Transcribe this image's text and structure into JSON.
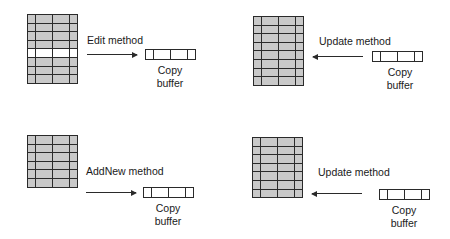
{
  "panels": [
    {
      "id": "edit",
      "method_label": "Edit method",
      "arrow_direction": "right",
      "grid_rows": 8,
      "highlighted_row": 5,
      "buffer_caption_line1": "Copy",
      "buffer_caption_line2": "buffer"
    },
    {
      "id": "update-top",
      "method_label": "Update method",
      "arrow_direction": "left",
      "grid_rows": 8,
      "highlighted_row": null,
      "buffer_caption_line1": "Copy",
      "buffer_caption_line2": "buffer"
    },
    {
      "id": "addnew",
      "method_label": "AddNew method",
      "arrow_direction": "right",
      "grid_rows": 6,
      "highlighted_row": null,
      "buffer_caption_line1": "Copy",
      "buffer_caption_line2": "buffer"
    },
    {
      "id": "update-bottom",
      "method_label": "Update method",
      "arrow_direction": "left",
      "grid_rows": 7,
      "highlighted_row": null,
      "buffer_caption_line1": "Copy",
      "buffer_caption_line2": "buffer"
    }
  ],
  "colors": {
    "grid_fill": "#c9c9c9",
    "grid_line": "#2a2a2a",
    "highlight_row": "#ffffff",
    "background": "#ffffff"
  }
}
